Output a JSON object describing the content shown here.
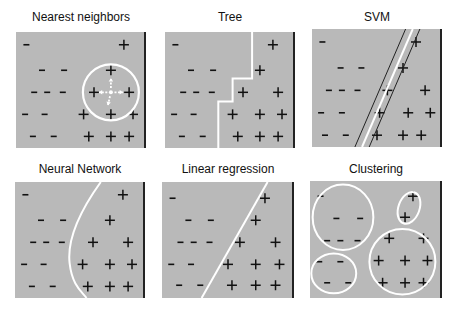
{
  "colors": {
    "panel_bg": "#b9b9b9",
    "panel_border": "#222222",
    "boundary": "#ffffff",
    "marker": "#111111"
  },
  "panels": [
    {
      "title": "Nearest neighbors",
      "boundary": "circle-neighborhood"
    },
    {
      "title": "Tree",
      "boundary": "axis-aligned-step"
    },
    {
      "title": "SVM",
      "boundary": "max-margin-line"
    },
    {
      "title": "Neural Network",
      "boundary": "smooth-curve"
    },
    {
      "title": "Linear regression",
      "boundary": "straight-line"
    },
    {
      "title": "Clustering",
      "boundary": "cluster-ellipses"
    }
  ],
  "points": {
    "minus": [
      [
        0.08,
        0.11
      ],
      [
        0.2,
        0.33
      ],
      [
        0.37,
        0.33
      ],
      [
        0.14,
        0.52
      ],
      [
        0.24,
        0.52
      ],
      [
        0.36,
        0.52
      ],
      [
        0.07,
        0.71
      ],
      [
        0.22,
        0.71
      ],
      [
        0.13,
        0.9
      ],
      [
        0.29,
        0.9
      ]
    ],
    "plus": [
      [
        0.83,
        0.11
      ],
      [
        0.73,
        0.33
      ],
      [
        0.6,
        0.52
      ],
      [
        0.87,
        0.52
      ],
      [
        0.52,
        0.71
      ],
      [
        0.73,
        0.71
      ],
      [
        0.9,
        0.71
      ],
      [
        0.56,
        0.9
      ],
      [
        0.73,
        0.9
      ],
      [
        0.87,
        0.9
      ]
    ]
  }
}
